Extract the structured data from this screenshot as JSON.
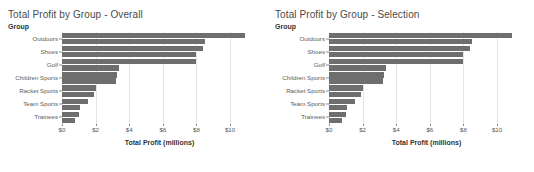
{
  "panels": [
    {
      "title": "Total Profit by Group - Overall",
      "group_header": "Group",
      "xlabel": "Total Profit (millions)"
    },
    {
      "title": "Total Profit by Group - Selection",
      "group_header": "Group",
      "xlabel": "Total Profit (millions)"
    }
  ],
  "chart_data": [
    {
      "type": "bar",
      "orientation": "horizontal",
      "title": "Total Profit by Group - Overall",
      "xlabel": "Total Profit (millions)",
      "ylabel": "Group",
      "categories": [
        "Outdoors",
        "Shoes",
        "Golf",
        "Children Sports",
        "Racket Sports",
        "Team Sports",
        "Trainees"
      ],
      "series": [
        {
          "name": "upper",
          "values": [
            10.9,
            8.4,
            8.0,
            3.3,
            2.0,
            1.55,
            1.0
          ]
        },
        {
          "name": "lower",
          "values": [
            8.5,
            8.0,
            3.4,
            3.2,
            1.9,
            1.1,
            0.75
          ]
        }
      ],
      "tick_labels": [
        "$0",
        "$2",
        "$4",
        "$6",
        "$8",
        "$10"
      ],
      "tick_values": [
        0,
        2,
        4,
        6,
        8,
        10
      ],
      "xlim": [
        0,
        11.6
      ],
      "grid": true,
      "legend": "none",
      "bar_color": "#6e6e6e"
    },
    {
      "type": "bar",
      "orientation": "horizontal",
      "title": "Total Profit by Group - Selection",
      "xlabel": "Total Profit (millions)",
      "ylabel": "Group",
      "categories": [
        "Outdoors",
        "Shoes",
        "Golf",
        "Children Sports",
        "Racket Sports",
        "Team Sports",
        "Trainees"
      ],
      "series": [
        {
          "name": "upper",
          "values": [
            10.9,
            8.4,
            8.0,
            3.3,
            2.0,
            1.55,
            1.0
          ]
        },
        {
          "name": "lower",
          "values": [
            8.5,
            8.0,
            3.4,
            3.2,
            1.9,
            1.1,
            0.75
          ]
        }
      ],
      "tick_labels": [
        "$0",
        "$2",
        "$4",
        "$6",
        "$8",
        "$10"
      ],
      "tick_values": [
        0,
        2,
        4,
        6,
        8,
        10
      ],
      "xlim": [
        0,
        11.6
      ],
      "grid": true,
      "legend": "none",
      "bar_color": "#6e6e6e"
    }
  ]
}
